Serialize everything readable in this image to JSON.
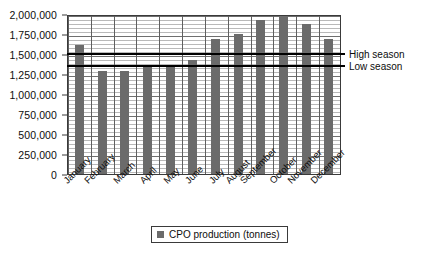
{
  "chart_data": {
    "type": "bar",
    "title": "",
    "xlabel": "",
    "ylabel": "",
    "ylim": [
      0,
      2000000
    ],
    "grid": true,
    "legend_position": "bottom",
    "categories": [
      "January",
      "February",
      "March",
      "April",
      "May",
      "June",
      "July",
      "August",
      "September",
      "October",
      "November",
      "December"
    ],
    "series": [
      {
        "name": "CPO production (tonnes)",
        "color": "#6b6b6b",
        "values": [
          1610000,
          1290000,
          1290000,
          1350000,
          1360000,
          1430000,
          1690000,
          1750000,
          1930000,
          1990000,
          1880000,
          1690000
        ]
      }
    ],
    "y_ticks": [
      {
        "value": 2000000,
        "label": "2,000,000"
      },
      {
        "value": 1750000,
        "label": "1,750,000"
      },
      {
        "value": 1500000,
        "label": "1,500,000"
      },
      {
        "value": 1250000,
        "label": "1,250,000"
      },
      {
        "value": 1000000,
        "label": "1,000,000"
      },
      {
        "value": 750000,
        "label": "750,000"
      },
      {
        "value": 500000,
        "label": "500,000"
      },
      {
        "value": 250000,
        "label": "250,000"
      },
      {
        "value": 0,
        "label": "0"
      }
    ],
    "annotations": [
      {
        "name": "high-season",
        "label": "High season",
        "value": 1530000,
        "color": "#000000"
      },
      {
        "name": "low-season",
        "label": "Low season",
        "value": 1370000,
        "color": "#000000"
      }
    ]
  },
  "legend": {
    "label": "CPO production (tonnes)",
    "swatch_color": "#6b6b6b"
  }
}
